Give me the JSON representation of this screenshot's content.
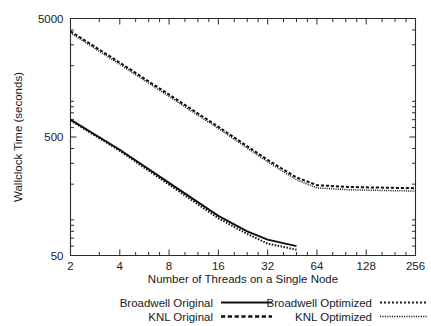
{
  "chart_data": {
    "type": "line",
    "title": "",
    "xlabel": "Number of Threads on a Single Node",
    "ylabel": "Wallclock Time (seconds)",
    "xscale": "log2",
    "yscale": "log10",
    "xlim": [
      2,
      256
    ],
    "ylim": [
      50,
      5000
    ],
    "grid": false,
    "xticks": [
      2,
      4,
      8,
      16,
      32,
      64,
      128,
      256
    ],
    "xtick_labels": [
      "2",
      "4",
      "8",
      "16",
      "32",
      "64",
      "128",
      "256"
    ],
    "yticks": [
      50,
      500,
      5000
    ],
    "ytick_labels": [
      "50",
      "500",
      "5000"
    ],
    "minor_ticks": true,
    "legend_position": "below-axes",
    "series": [
      {
        "name": "Broadwell Original",
        "style": "solid",
        "x": [
          2,
          4,
          8,
          16,
          24,
          32,
          48
        ],
        "values": [
          700,
          390,
          205,
          108,
          80,
          68,
          60
        ]
      },
      {
        "name": "KNL Original",
        "style": "dashed",
        "x": [
          2,
          4,
          8,
          16,
          32,
          48,
          64,
          96,
          128,
          192,
          256
        ],
        "values": [
          3900,
          2120,
          1140,
          610,
          320,
          228,
          196,
          190,
          188,
          186,
          185
        ]
      },
      {
        "name": "Broadwell Optimized",
        "style": "dotted",
        "x": [
          2,
          4,
          8,
          16,
          24,
          32,
          48
        ],
        "values": [
          690,
          382,
          198,
          103,
          76,
          63,
          56
        ]
      },
      {
        "name": "KNL Optimized",
        "style": "fine-dotted",
        "x": [
          2,
          4,
          8,
          16,
          32,
          48,
          64,
          96,
          128,
          192,
          256
        ],
        "values": [
          3780,
          2050,
          1100,
          590,
          308,
          218,
          186,
          180,
          178,
          176,
          175
        ]
      }
    ],
    "legend": [
      {
        "label": "Broadwell Original",
        "style": "solid"
      },
      {
        "label": "KNL Original",
        "style": "dashed"
      },
      {
        "label": "Broadwell Optimized",
        "style": "dotted"
      },
      {
        "label": "KNL Optimized",
        "style": "fine-dotted"
      }
    ]
  },
  "colors": {
    "ink": "#111111",
    "axis": "#2b2b2b",
    "background": "#ffffff"
  }
}
